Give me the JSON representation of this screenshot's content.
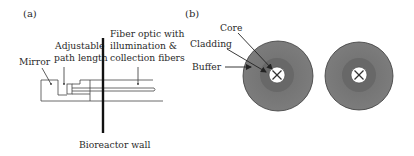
{
  "figure": {
    "panel_a": {
      "label": "(a)",
      "labels": {
        "mirror": "Mirror",
        "adjustable_line1": "Adjustable",
        "adjustable_line2": "path length",
        "fiber_line1": "Fiber optic with",
        "fiber_line2": "illumination &",
        "fiber_line3": "collection fibers",
        "wall": "Bioreactor wall"
      }
    },
    "panel_b": {
      "label": "(b)",
      "labels": {
        "core": "Core",
        "cladding": "Cladding",
        "buffer": "Buffer"
      },
      "colors": {
        "buffer": "#7a7a7a",
        "cladding": "#666666",
        "core": "#ffffff",
        "outline": "#333333"
      }
    }
  }
}
